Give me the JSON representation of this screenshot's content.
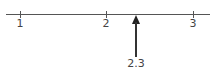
{
  "number_line": {
    "ticks": [
      {
        "label": "1",
        "value": 1
      },
      {
        "label": "2",
        "value": 2
      },
      {
        "label": "3",
        "value": 3
      }
    ],
    "marker": {
      "label": "2.3",
      "value": 2.3
    }
  },
  "colors": {
    "line": "#555555",
    "arrow": "#333333"
  }
}
